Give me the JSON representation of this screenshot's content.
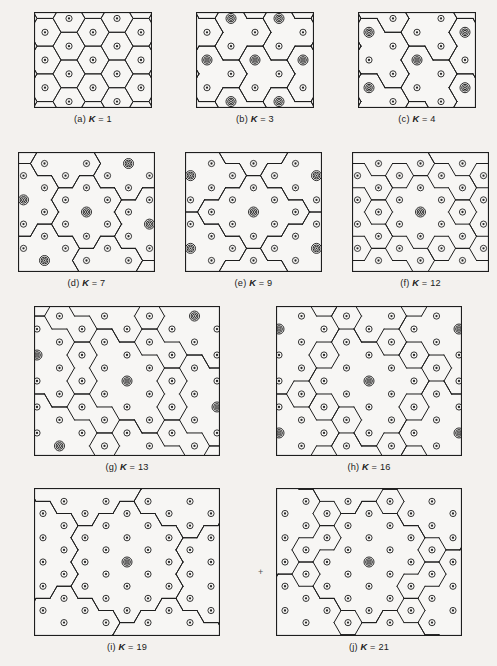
{
  "figure": {
    "background_color": "#f3f1ee",
    "cell_fill": "#f7f6f4",
    "line_color": "#1e1e1e",
    "marker_color": "#2a2a2a",
    "panels": [
      {
        "id": "a",
        "label_prefix": "(a)",
        "k_symbol": "K",
        "k_equals": "=",
        "k_value": "1",
        "caption": "(a) K = 1",
        "x": 34,
        "y": 12,
        "w": 118,
        "h": 96,
        "hex_r": 16.0,
        "origin_x": 0,
        "origin_y": 0,
        "orientation": "flat-top",
        "cluster_outline_hexes": [
          [
            0,
            0
          ]
        ],
        "cochannel_hexes": [],
        "note": "every cell is its own cluster; all cell outlines drawn"
      },
      {
        "id": "b",
        "label_prefix": "(b)",
        "k_symbol": "K",
        "k_equals": "=",
        "k_value": "3",
        "caption": "(b) K = 3",
        "x": 196,
        "y": 12,
        "w": 118,
        "h": 96,
        "hex_r": 16.0,
        "origin_x": 0,
        "origin_y": 0,
        "orientation": "flat-top",
        "cluster_outline_hexes": [
          [
            0,
            0
          ],
          [
            1,
            0
          ],
          [
            0,
            1
          ]
        ],
        "cochannel_hexes": [
          [
            -1,
            -1
          ],
          [
            1,
            -1
          ],
          [
            3,
            -1
          ],
          [
            -1,
            1
          ],
          [
            1,
            1
          ]
        ],
        "note": "3-cell clusters, reuse distance 3"
      },
      {
        "id": "c",
        "label_prefix": "(c)",
        "k_symbol": "K",
        "k_equals": "=",
        "k_value": "4",
        "caption": "(c) K = 4",
        "x": 358,
        "y": 12,
        "w": 118,
        "h": 96,
        "hex_r": 16.0,
        "origin_x": 0,
        "origin_y": 0,
        "orientation": "flat-top",
        "cluster_outline_hexes": [
          [
            0,
            0
          ],
          [
            1,
            0
          ],
          [
            0,
            1
          ],
          [
            1,
            1
          ]
        ],
        "cochannel_hexes": [
          [
            -2,
            -1
          ],
          [
            2,
            -1
          ],
          [
            -2,
            0
          ],
          [
            2,
            0
          ],
          [
            -2,
            1
          ],
          [
            2,
            1
          ]
        ],
        "note": "4-cell clusters"
      },
      {
        "id": "d",
        "label_prefix": "(d)",
        "k_symbol": "K",
        "k_equals": "=",
        "k_value": "7",
        "caption": "(d) K = 7",
        "x": 18,
        "y": 152,
        "w": 137,
        "h": 120,
        "hex_r": 14.0,
        "origin_x": 0,
        "origin_y": 0,
        "orientation": "flat-top",
        "cluster_outline_hexes": [
          [
            0,
            0
          ],
          [
            1,
            0
          ],
          [
            -1,
            0
          ],
          [
            0,
            1
          ],
          [
            0,
            -1
          ],
          [
            1,
            -1
          ],
          [
            -1,
            1
          ]
        ],
        "cochannel_hexes": [
          [
            3,
            1
          ],
          [
            -3,
            -1
          ],
          [
            2,
            -2
          ],
          [
            -2,
            2
          ]
        ],
        "note": "classic 7-cell reuse cluster"
      },
      {
        "id": "e",
        "label_prefix": "(e)",
        "k_symbol": "K",
        "k_equals": "=",
        "k_value": "9",
        "caption": "(e) K = 9",
        "x": 185,
        "y": 152,
        "w": 137,
        "h": 120,
        "hex_r": 14.0,
        "origin_x": 0,
        "origin_y": 0,
        "orientation": "flat-top",
        "cluster_outline_hexes": [
          [
            0,
            0
          ],
          [
            1,
            0
          ],
          [
            -1,
            0
          ],
          [
            0,
            1
          ],
          [
            0,
            -1
          ],
          [
            1,
            -1
          ],
          [
            -1,
            1
          ],
          [
            2,
            -1
          ],
          [
            -2,
            1
          ]
        ],
        "cochannel_hexes": [
          [
            3,
            0
          ],
          [
            -3,
            0
          ]
        ],
        "note": "9-cell cluster, hexagonal super-cell"
      },
      {
        "id": "f",
        "label_prefix": "(f)",
        "k_symbol": "K",
        "k_equals": "=",
        "k_value": "12",
        "caption": "(f) K = 12",
        "x": 352,
        "y": 152,
        "w": 137,
        "h": 120,
        "hex_r": 14.0,
        "origin_x": 0,
        "origin_y": 0,
        "orientation": "flat-top",
        "cluster_outline_hexes": [
          [
            0,
            0
          ],
          [
            1,
            0
          ],
          [
            -1,
            0
          ],
          [
            0,
            1
          ],
          [
            0,
            -1
          ],
          [
            1,
            -1
          ],
          [
            -1,
            1
          ],
          [
            2,
            -1
          ],
          [
            -2,
            1
          ],
          [
            1,
            1
          ],
          [
            -1,
            -1
          ],
          [
            2,
            0
          ]
        ],
        "cochannel_hexes": [],
        "note": "12-cell cluster"
      },
      {
        "id": "g",
        "label_prefix": "(g)",
        "k_symbol": "K",
        "k_equals": "=",
        "k_value": "13",
        "caption": "(g) K = 13",
        "x": 34,
        "y": 306,
        "w": 186,
        "h": 150,
        "hex_r": 15.0,
        "origin_x": 0,
        "origin_y": 0,
        "orientation": "flat-top",
        "cluster_outline_hexes": [
          [
            0,
            0
          ],
          [
            1,
            0
          ],
          [
            -1,
            0
          ],
          [
            0,
            1
          ],
          [
            0,
            -1
          ],
          [
            1,
            -1
          ],
          [
            -1,
            1
          ],
          [
            2,
            -1
          ],
          [
            -2,
            1
          ],
          [
            1,
            1
          ],
          [
            -1,
            -1
          ],
          [
            2,
            0
          ],
          [
            -2,
            0
          ]
        ],
        "cochannel_hexes": [
          [
            5,
            0
          ]
        ],
        "note": "13-cell cluster"
      },
      {
        "id": "h",
        "label_prefix": "(h)",
        "k_symbol": "K",
        "k_equals": "=",
        "k_value": "16",
        "caption": "(h) K = 16",
        "x": 276,
        "y": 306,
        "w": 186,
        "h": 150,
        "hex_r": 15.0,
        "origin_x": 0,
        "origin_y": 0,
        "orientation": "flat-top",
        "cluster_outline_hexes": [
          [
            0,
            0
          ],
          [
            1,
            0
          ],
          [
            -1,
            0
          ],
          [
            0,
            1
          ],
          [
            0,
            -1
          ],
          [
            1,
            -1
          ],
          [
            -1,
            1
          ],
          [
            2,
            -1
          ],
          [
            -2,
            1
          ],
          [
            1,
            1
          ],
          [
            -1,
            -1
          ],
          [
            2,
            0
          ],
          [
            -2,
            0
          ],
          [
            2,
            -2
          ],
          [
            -2,
            2
          ],
          [
            0,
            2
          ]
        ],
        "cochannel_hexes": [
          [
            -4,
            -2
          ],
          [
            -4,
            2
          ]
        ],
        "note": "16-cell cluster"
      },
      {
        "id": "i",
        "label_prefix": "(i)",
        "k_symbol": "K",
        "k_equals": "=",
        "k_value": "19",
        "caption": "(i) K = 19",
        "x": 34,
        "y": 488,
        "w": 186,
        "h": 148,
        "hex_r": 14.0,
        "origin_x": 0,
        "origin_y": 0,
        "orientation": "flat-top",
        "cluster_outline_hexes": [
          [
            0,
            0
          ],
          [
            1,
            0
          ],
          [
            -1,
            0
          ],
          [
            0,
            1
          ],
          [
            0,
            -1
          ],
          [
            1,
            -1
          ],
          [
            -1,
            1
          ],
          [
            2,
            0
          ],
          [
            -2,
            0
          ],
          [
            2,
            -1
          ],
          [
            -2,
            1
          ],
          [
            1,
            1
          ],
          [
            -1,
            -1
          ],
          [
            2,
            -2
          ],
          [
            -2,
            2
          ],
          [
            0,
            2
          ],
          [
            0,
            -2
          ],
          [
            1,
            -2
          ],
          [
            -1,
            2
          ]
        ],
        "cochannel_hexes": [],
        "note": "19-cell cluster"
      },
      {
        "id": "j",
        "label_prefix": "(j)",
        "k_symbol": "K",
        "k_equals": "=",
        "k_value": "21",
        "caption": "(j) K = 21",
        "x": 276,
        "y": 488,
        "w": 186,
        "h": 148,
        "hex_r": 14.0,
        "origin_x": 0,
        "origin_y": 0,
        "orientation": "flat-top",
        "cluster_outline_hexes": [
          [
            0,
            0
          ],
          [
            1,
            0
          ],
          [
            -1,
            0
          ],
          [
            0,
            1
          ],
          [
            0,
            -1
          ],
          [
            1,
            -1
          ],
          [
            -1,
            1
          ],
          [
            2,
            0
          ],
          [
            -2,
            0
          ],
          [
            2,
            -1
          ],
          [
            -2,
            1
          ],
          [
            1,
            1
          ],
          [
            -1,
            -1
          ],
          [
            2,
            -2
          ],
          [
            -2,
            2
          ],
          [
            0,
            2
          ],
          [
            0,
            -2
          ],
          [
            1,
            -2
          ],
          [
            -1,
            2
          ],
          [
            3,
            -1
          ],
          [
            -3,
            1
          ]
        ],
        "cochannel_hexes": [],
        "note": "21-cell cluster"
      }
    ],
    "markers": {
      "normal_name": "cell-site-marker",
      "cochannel_name": "co-channel-cell-site-marker",
      "normal_radius": 3.1,
      "cochannel_radius": 5.0
    },
    "registration_mark": "+"
  },
  "bleed_through_text": [
    "of the reverse page showing through the scan",
    "faint ghosted body text, not part of the figure"
  ]
}
